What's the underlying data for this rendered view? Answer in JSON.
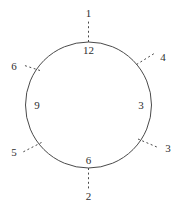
{
  "figure": {
    "type": "clock-face-diagram",
    "background_color": "#ffffff",
    "stroke_color": "#4a4a4a",
    "text_color": "#2f2f2f"
  },
  "circle": {
    "center_x": 88.5,
    "center_y": 105.0,
    "radius": 63.0,
    "stroke_width": 1.0
  },
  "inner_labels": [
    {
      "text": "12",
      "x": 88.5,
      "y": 50.0,
      "angle_deg": 90
    },
    {
      "text": "3",
      "x": 141.0,
      "y": 105.0,
      "angle_deg": 0
    },
    {
      "text": "6",
      "x": 88.5,
      "y": 160.0,
      "angle_deg": 270
    },
    {
      "text": "9",
      "x": 37.0,
      "y": 105.0,
      "angle_deg": 180
    }
  ],
  "outer_labels": [
    {
      "text": "1",
      "x": 88.5,
      "y": 13.0,
      "angle_deg": 90
    },
    {
      "text": "4",
      "x": 163.0,
      "y": 57.0,
      "angle_deg": 40
    },
    {
      "text": "3",
      "x": 168.0,
      "y": 148.0,
      "angle_deg": -38
    },
    {
      "text": "2",
      "x": 88.5,
      "y": 196.0,
      "angle_deg": 270
    },
    {
      "text": "5",
      "x": 14.0,
      "y": 152.0,
      "angle_deg": 218
    },
    {
      "text": "6",
      "x": 14.0,
      "y": 66.0,
      "angle_deg": 142
    }
  ],
  "tick_marks": [
    {
      "name": "tick-top",
      "x1": 88.5,
      "y1": 42.0,
      "x2": 88.5,
      "y2": 21.0
    },
    {
      "name": "tick-upper-right",
      "x1": 136.5,
      "y1": 64.5,
      "x2": 155.0,
      "y2": 53.0
    },
    {
      "name": "tick-lower-right",
      "x1": 138.0,
      "y1": 139.0,
      "x2": 158.0,
      "y2": 147.5
    },
    {
      "name": "tick-bottom",
      "x1": 88.5,
      "y1": 168.0,
      "x2": 88.5,
      "y2": 189.0
    },
    {
      "name": "tick-lower-left",
      "x1": 41.5,
      "y1": 142.5,
      "x2": 23.0,
      "y2": 152.0
    },
    {
      "name": "tick-upper-left",
      "x1": 40.0,
      "y1": 70.5,
      "x2": 23.0,
      "y2": 65.0
    }
  ],
  "dash_pattern": "2 2.6"
}
